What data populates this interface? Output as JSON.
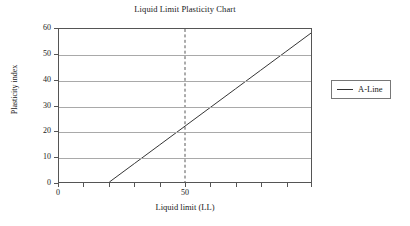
{
  "chart_data": {
    "type": "line",
    "title": "Liquid Limit Plasticity Chart",
    "xlabel": "Liquid limit (LL)",
    "ylabel": "Plasticity index",
    "xlim": [
      0,
      100
    ],
    "ylim": [
      0,
      60
    ],
    "grid": true,
    "legend_position": "right",
    "x_ticks": [
      0,
      10,
      20,
      30,
      40,
      50,
      60,
      70,
      80,
      90,
      100
    ],
    "x_tick_labels": [
      "0",
      "",
      "",
      "",
      "",
      "50",
      "",
      "",
      "",
      "",
      ""
    ],
    "y_ticks": [
      0,
      10,
      20,
      30,
      40,
      50,
      60
    ],
    "y_tick_labels": [
      "0",
      "10",
      "20",
      "30",
      "40",
      "50",
      "60"
    ],
    "series": [
      {
        "name": "A-Line",
        "color": "#333333",
        "style": "solid",
        "x": [
          20,
          30,
          40,
          50,
          60,
          70,
          80,
          90,
          100
        ],
        "values": [
          0,
          7.3,
          14.6,
          21.9,
          29.2,
          36.5,
          43.8,
          51.1,
          58.4
        ]
      }
    ],
    "annotations": [
      {
        "name": "ll-50-reference",
        "type": "vline",
        "x": 50,
        "style": "dashed",
        "color": "#555555"
      }
    ]
  },
  "legend": {
    "entries": [
      {
        "label": "A-Line"
      }
    ]
  }
}
